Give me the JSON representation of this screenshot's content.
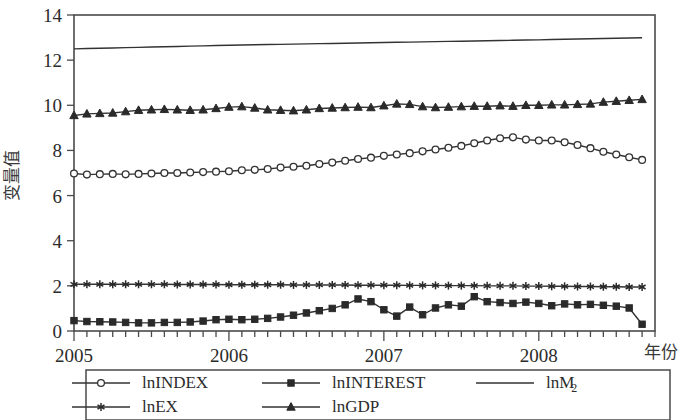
{
  "chart_data": {
    "type": "line",
    "title": "",
    "xlabel": "年份",
    "ylabel": "变量值",
    "xlim": [
      2005.0,
      2008.75
    ],
    "ylim": [
      0,
      14
    ],
    "yticks": [
      0,
      2,
      4,
      6,
      8,
      10,
      12,
      14
    ],
    "xticks": [
      2005,
      2006,
      2007,
      2008
    ],
    "xtick_labels": [
      "2005",
      "2006",
      "2007",
      "2008"
    ],
    "minor_xticks_per_year": 12,
    "grid": false,
    "legend_position": "below-plot",
    "x": [
      2005.0,
      2005.0833,
      2005.1667,
      2005.25,
      2005.3333,
      2005.4167,
      2005.5,
      2005.5833,
      2005.6667,
      2005.75,
      2005.8333,
      2005.9167,
      2006.0,
      2006.0833,
      2006.1667,
      2006.25,
      2006.3333,
      2006.4167,
      2006.5,
      2006.5833,
      2006.6667,
      2006.75,
      2006.8333,
      2006.9167,
      2007.0,
      2007.0833,
      2007.1667,
      2007.25,
      2007.3333,
      2007.4167,
      2007.5,
      2007.5833,
      2007.6667,
      2007.75,
      2007.8333,
      2007.9167,
      2008.0,
      2008.0833,
      2008.1667,
      2008.25,
      2008.3333,
      2008.4167,
      2008.5,
      2008.5833,
      2008.6667
    ],
    "series": [
      {
        "name": "lnINDEX",
        "marker": "open-circle",
        "values": [
          6.98,
          6.93,
          6.95,
          6.96,
          6.94,
          6.96,
          6.98,
          7.0,
          7.0,
          7.02,
          7.04,
          7.06,
          7.08,
          7.12,
          7.14,
          7.18,
          7.24,
          7.28,
          7.32,
          7.4,
          7.46,
          7.54,
          7.62,
          7.68,
          7.76,
          7.82,
          7.88,
          7.96,
          8.04,
          8.12,
          8.2,
          8.32,
          8.44,
          8.54,
          8.58,
          8.48,
          8.44,
          8.44,
          8.36,
          8.24,
          8.1,
          7.94,
          7.82,
          7.7,
          7.58
        ]
      },
      {
        "name": "lnINTEREST",
        "marker": "filled-square",
        "values": [
          0.46,
          0.42,
          0.41,
          0.4,
          0.38,
          0.36,
          0.36,
          0.38,
          0.38,
          0.4,
          0.44,
          0.5,
          0.52,
          0.5,
          0.52,
          0.56,
          0.62,
          0.7,
          0.8,
          0.9,
          1.0,
          1.16,
          1.42,
          1.3,
          0.94,
          0.66,
          1.06,
          0.72,
          1.02,
          1.16,
          1.1,
          1.52,
          1.3,
          1.26,
          1.22,
          1.28,
          1.22,
          1.12,
          1.2,
          1.16,
          1.18,
          1.14,
          1.1,
          1.02,
          0.3
        ]
      },
      {
        "name": "lnM2",
        "marker": "none",
        "values": [
          12.5,
          12.513,
          12.527,
          12.54,
          12.553,
          12.567,
          12.58,
          12.593,
          12.607,
          12.62,
          12.633,
          12.647,
          12.66,
          12.67,
          12.68,
          12.69,
          12.7,
          12.71,
          12.72,
          12.73,
          12.74,
          12.75,
          12.76,
          12.77,
          12.78,
          12.79,
          12.8,
          12.81,
          12.82,
          12.83,
          12.84,
          12.85,
          12.86,
          12.87,
          12.88,
          12.89,
          12.9,
          12.912,
          12.924,
          12.936,
          12.948,
          12.958,
          12.968,
          12.98,
          12.995
        ]
      },
      {
        "name": "lnEX",
        "marker": "asterisk",
        "values": [
          2.07,
          2.07,
          2.07,
          2.07,
          2.07,
          2.07,
          2.07,
          2.07,
          2.06,
          2.06,
          2.06,
          2.06,
          2.05,
          2.05,
          2.05,
          2.05,
          2.05,
          2.04,
          2.04,
          2.04,
          2.04,
          2.04,
          2.03,
          2.03,
          2.03,
          2.03,
          2.02,
          2.02,
          2.02,
          2.01,
          2.01,
          2.01,
          2.0,
          2.0,
          2.0,
          1.99,
          1.99,
          1.98,
          1.98,
          1.97,
          1.97,
          1.96,
          1.96,
          1.95,
          1.95
        ]
      },
      {
        "name": "lnGDP",
        "marker": "filled-triangle",
        "values": [
          9.55,
          9.62,
          9.64,
          9.66,
          9.72,
          9.78,
          9.8,
          9.82,
          9.8,
          9.78,
          9.8,
          9.86,
          9.92,
          9.94,
          9.88,
          9.8,
          9.78,
          9.76,
          9.8,
          9.86,
          9.88,
          9.9,
          9.92,
          9.9,
          9.98,
          10.06,
          10.04,
          9.94,
          9.9,
          9.92,
          9.94,
          9.96,
          9.96,
          9.98,
          9.96,
          10.0,
          10.0,
          10.02,
          10.02,
          10.04,
          10.06,
          10.14,
          10.18,
          10.22,
          10.26
        ]
      }
    ]
  },
  "axes": {
    "y_title": "变量值",
    "x_title": "年份",
    "y_tick_labels": [
      "0",
      "2",
      "4",
      "6",
      "8",
      "10",
      "12",
      "14"
    ],
    "x_tick_labels": [
      "2005",
      "2006",
      "2007",
      "2008"
    ]
  },
  "legend": {
    "entries": [
      {
        "label": "lnINDEX",
        "marker": "open-circle",
        "sub": ""
      },
      {
        "label": "lnINTEREST",
        "marker": "filled-square",
        "sub": ""
      },
      {
        "label": "lnM",
        "marker": "none",
        "sub": "2"
      },
      {
        "label": "lnEX",
        "marker": "asterisk",
        "sub": ""
      },
      {
        "label": "lnGDP",
        "marker": "filled-triangle",
        "sub": ""
      }
    ]
  },
  "colors": {
    "line": "#333333",
    "axis": "#4a4a4a",
    "text": "#2b2b2b",
    "background": "#ffffff"
  }
}
